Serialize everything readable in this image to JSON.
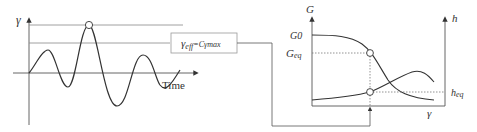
{
  "left_chart": {
    "y_axis_label": "γ",
    "x_axis_label": "Time",
    "levels": [
      "γmax",
      "γeff"
    ]
  },
  "formula_box": {
    "text_main": "γ",
    "text_sub": "eff",
    "text_rest": "=Cγmax"
  },
  "right_chart": {
    "left_axis_label": "G",
    "right_axis_label": "h",
    "x_axis_label": "γ",
    "labels": {
      "g0": "G0",
      "g_eq_main": "G",
      "g_eq_sub": "eq",
      "h_eq_main": "h",
      "h_eq_sub": "eq"
    }
  },
  "colors": {
    "line": "#333333",
    "thin": "#888888",
    "dotted": "#777777"
  }
}
